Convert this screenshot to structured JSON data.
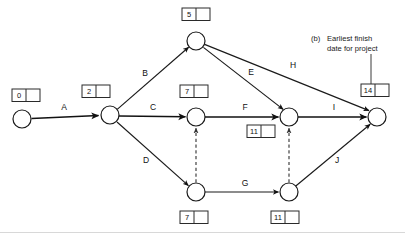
{
  "diagram": {
    "type": "pert-network",
    "nodes": [
      {
        "id": "n1",
        "name": "start-node",
        "cx": 22,
        "cy": 119,
        "r": 9
      },
      {
        "id": "n2",
        "name": "node-after-a",
        "cx": 110,
        "cy": 115,
        "r": 9
      },
      {
        "id": "n3",
        "name": "top-node",
        "cx": 196,
        "cy": 41,
        "r": 9
      },
      {
        "id": "n4",
        "name": "middle-node",
        "cx": 196,
        "cy": 117,
        "r": 9
      },
      {
        "id": "n5",
        "name": "lower-middle-node",
        "cx": 196,
        "cy": 192,
        "r": 9
      },
      {
        "id": "n6",
        "name": "right-middle-node",
        "cx": 289,
        "cy": 117,
        "r": 9
      },
      {
        "id": "n7",
        "name": "lower-right-node",
        "cx": 289,
        "cy": 192,
        "r": 9
      },
      {
        "id": "n8",
        "name": "finish-node",
        "cx": 377,
        "cy": 117,
        "r": 9
      }
    ],
    "event_boxes": [
      {
        "id": "b0",
        "value": "0",
        "x": 12,
        "y": 89,
        "for_node": "start-node"
      },
      {
        "id": "b2",
        "value": "2",
        "x": 82,
        "y": 85,
        "for_node": "node-after-a"
      },
      {
        "id": "b5",
        "value": "5",
        "x": 182,
        "y": 8,
        "for_node": "top-node"
      },
      {
        "id": "b7a",
        "value": "7",
        "x": 180,
        "y": 85,
        "for_node": "middle-node"
      },
      {
        "id": "b11a",
        "value": "11",
        "x": 247,
        "y": 125,
        "for_node": "right-middle-node"
      },
      {
        "id": "b14",
        "value": "14",
        "x": 361,
        "y": 84,
        "for_node": "finish-node"
      },
      {
        "id": "b7b",
        "value": "7",
        "x": 180,
        "y": 211,
        "for_node": "lower-middle-node"
      },
      {
        "id": "b11b",
        "value": "11",
        "x": 271,
        "y": 211,
        "for_node": "lower-right-node"
      }
    ],
    "activities": [
      {
        "id": "A",
        "label": "A",
        "from": "start-node",
        "to": "node-after-a",
        "lx": 64,
        "ly": 108,
        "style": "solid"
      },
      {
        "id": "B",
        "label": "B",
        "from": "node-after-a",
        "to": "top-node",
        "lx": 145,
        "ly": 74,
        "style": "solid"
      },
      {
        "id": "C",
        "label": "C",
        "from": "node-after-a",
        "to": "middle-node",
        "lx": 153,
        "ly": 108,
        "style": "solid"
      },
      {
        "id": "D",
        "label": "D",
        "from": "node-after-a",
        "to": "lower-middle-node",
        "lx": 146,
        "ly": 161,
        "style": "solid"
      },
      {
        "id": "E",
        "label": "E",
        "from": "top-node",
        "to": "right-middle-node",
        "lx": 251,
        "ly": 73,
        "style": "solid"
      },
      {
        "id": "F",
        "label": "F",
        "from": "middle-node",
        "to": "right-middle-node",
        "lx": 245,
        "ly": 108,
        "style": "solid"
      },
      {
        "id": "G",
        "label": "G",
        "from": "lower-middle-node",
        "to": "lower-right-node",
        "lx": 245,
        "ly": 184,
        "style": "solid"
      },
      {
        "id": "H",
        "label": "H",
        "from": "top-node",
        "to": "finish-node",
        "lx": 293,
        "ly": 66,
        "style": "solid"
      },
      {
        "id": "I",
        "label": "I",
        "from": "right-middle-node",
        "to": "finish-node",
        "lx": 334,
        "ly": 108,
        "style": "solid"
      },
      {
        "id": "J",
        "label": "J",
        "from": "lower-right-node",
        "to": "finish-node",
        "lx": 337,
        "ly": 161,
        "style": "solid"
      }
    ],
    "dummy_activities": [
      {
        "id": "dummy1",
        "from": "lower-middle-node",
        "to": "middle-node",
        "style": "dashed"
      },
      {
        "id": "dummy2",
        "from": "lower-right-node",
        "to": "right-middle-node",
        "style": "dashed"
      }
    ],
    "annotation": {
      "prefix": "(b)",
      "line1": "Earliest finish",
      "line2": "date for project",
      "x": 311,
      "y": 38,
      "leader_to": "b14"
    }
  }
}
